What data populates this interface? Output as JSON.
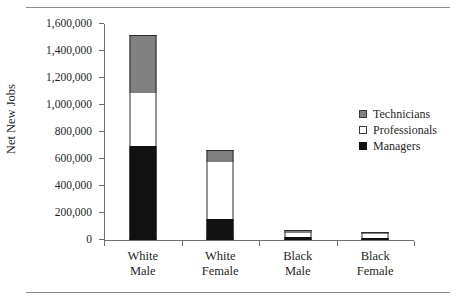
{
  "chart_data": {
    "type": "bar",
    "subtype": "stacked-bar",
    "title": "",
    "xlabel": "",
    "ylabel": "Net New Jobs",
    "ylim": [
      0,
      1600000
    ],
    "ytick_interval": 200000,
    "ytick_labels": [
      "0",
      "200,000",
      "400,000",
      "600,000",
      "800,000",
      "1,000,000",
      "1,200,000",
      "1,400,000",
      "1,600,000"
    ],
    "ytick_values": [
      0,
      200000,
      400000,
      600000,
      800000,
      1000000,
      1200000,
      1400000,
      1600000
    ],
    "grid": false,
    "legend_position": "right",
    "categories": [
      "White Male",
      "White Female",
      "Black Male",
      "Black Female"
    ],
    "category_lines": [
      [
        "White",
        "Male"
      ],
      [
        "White",
        "Female"
      ],
      [
        "Black",
        "Male"
      ],
      [
        "Black",
        "Female"
      ]
    ],
    "series": [
      {
        "name": "Managers",
        "color": "#111111",
        "values": [
          700000,
          155000,
          25000,
          12000
        ]
      },
      {
        "name": "Professionals",
        "color": "#ffffff",
        "values": [
          390000,
          425000,
          30000,
          33000
        ]
      },
      {
        "name": "Technicians",
        "color": "#808080",
        "values": [
          425000,
          90000,
          20000,
          15000
        ]
      }
    ],
    "totals": [
      1515000,
      670000,
      75000,
      60000
    ],
    "legend_order": [
      "Technicians",
      "Professionals",
      "Managers"
    ],
    "colors": {
      "technicians": "#808080",
      "professionals": "#ffffff",
      "managers": "#111111",
      "axis": "#6f6f6f",
      "rule": "#8d8d8d",
      "text": "#1f1f1f"
    }
  }
}
